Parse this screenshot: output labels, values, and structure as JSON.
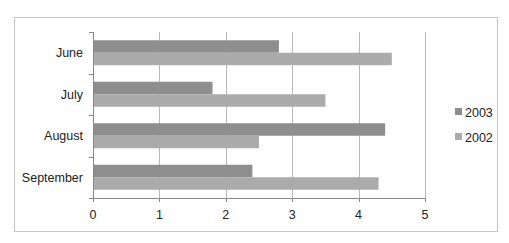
{
  "chart_data": {
    "type": "bar",
    "orientation": "horizontal",
    "title": "",
    "xlabel": "",
    "ylabel": "",
    "categories": [
      "June",
      "July",
      "August",
      "September"
    ],
    "series": [
      {
        "name": "2003",
        "values": [
          2.8,
          1.8,
          4.4,
          2.4
        ],
        "color": "#8e8e8e"
      },
      {
        "name": "2002",
        "values": [
          4.5,
          3.5,
          2.5,
          4.3
        ],
        "color": "#ababab"
      }
    ],
    "xlim": [
      0,
      5
    ],
    "xticks": [
      "0",
      "1",
      "2",
      "3",
      "4",
      "5"
    ],
    "grid": true,
    "legend": {
      "position": "right",
      "entries": [
        "2003",
        "2002"
      ]
    }
  }
}
